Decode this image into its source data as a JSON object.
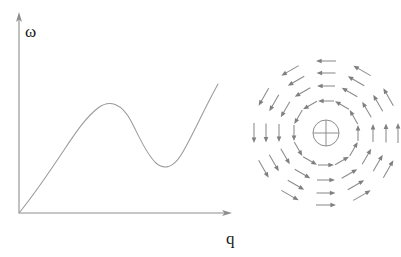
{
  "figure": {
    "name": "roton-dispersion-and-vortex-field",
    "background_color": "#ffffff",
    "width": 401,
    "height": 257,
    "line_color": "#8d8d8d",
    "curve_color": "#9a9a9a",
    "arrow_color": "#8a8a8a",
    "label_color": "#1a1a1a"
  },
  "panels": {
    "left": {
      "name": "dispersion-plot",
      "y_axis_label": "ω",
      "x_axis_label": "q",
      "y_axis_label_text": "omega",
      "x_axis_label_text": "q",
      "origin": {
        "x": 19,
        "y": 213
      },
      "x_axis_end": {
        "x": 231,
        "y": 213
      },
      "y_axis_end": {
        "x": 19,
        "y": 13
      }
    },
    "right": {
      "name": "vortex-field",
      "center": {
        "x": 326,
        "y": 133
      },
      "core_symbol": "circled-plus",
      "core_radius": 13,
      "rotation_sense": "counterclockwise",
      "ring_count": 4,
      "arrows_per_ring": 12,
      "ring_radii": [
        32,
        47,
        60,
        72
      ],
      "arrow_lengths": [
        16,
        18,
        19,
        20
      ]
    }
  },
  "chart_data": [
    {
      "type": "line",
      "name": "roton-dispersion-relation",
      "title": "",
      "xlabel": "q",
      "ylabel": "ω",
      "xlim": [
        0,
        1
      ],
      "ylim": [
        0,
        1
      ],
      "grid": false,
      "legend": "none",
      "axis_arrows": true,
      "tick_labels_x": [],
      "tick_labels_y": [],
      "description": "Dispersion relation with a linear phonon region at small q, a maxon maximum, a roton minimum, and a steeply rising branch at large q.",
      "features": [
        {
          "name": "origin",
          "q": 0.0,
          "omega": 0.0
        },
        {
          "name": "maxon-maximum",
          "q": 0.4,
          "omega": 0.62
        },
        {
          "name": "roton-minimum",
          "q": 0.66,
          "omega": 0.38
        },
        {
          "name": "curve-end",
          "q": 0.94,
          "omega": 0.9
        }
      ],
      "x": [
        0.0,
        0.05,
        0.1,
        0.15,
        0.2,
        0.25,
        0.3,
        0.35,
        0.4,
        0.45,
        0.5,
        0.55,
        0.6,
        0.65,
        0.7,
        0.75,
        0.8,
        0.85,
        0.9,
        0.94
      ],
      "y": [
        0.0,
        0.12,
        0.24,
        0.34,
        0.44,
        0.52,
        0.58,
        0.615,
        0.62,
        0.6,
        0.55,
        0.48,
        0.42,
        0.385,
        0.385,
        0.44,
        0.54,
        0.67,
        0.81,
        0.9
      ]
    },
    {
      "type": "scatter",
      "name": "vortex-velocity-field",
      "title": "",
      "xlabel": "",
      "ylabel": "",
      "grid": false,
      "legend": "none",
      "description": "Counterclockwise circulating velocity field around a vortex core marked by a circled-plus symbol; four concentric rings of twelve tangential arrows each.",
      "series": [
        {
          "name": "ring-1",
          "radius": 32,
          "arrow_count": 12,
          "arrow_length": 16,
          "direction": "counterclockwise"
        },
        {
          "name": "ring-2",
          "radius": 47,
          "arrow_count": 12,
          "arrow_length": 18,
          "direction": "counterclockwise"
        },
        {
          "name": "ring-3",
          "radius": 60,
          "arrow_count": 12,
          "arrow_length": 19,
          "direction": "counterclockwise"
        },
        {
          "name": "ring-4",
          "radius": 72,
          "arrow_count": 12,
          "arrow_length": 20,
          "direction": "counterclockwise"
        }
      ],
      "angles_deg": [
        0,
        30,
        60,
        90,
        120,
        150,
        180,
        210,
        240,
        270,
        300,
        330
      ]
    }
  ]
}
